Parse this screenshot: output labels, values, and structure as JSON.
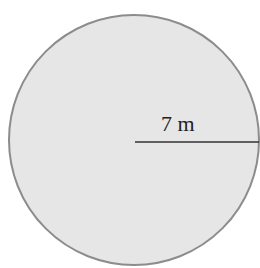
{
  "figure": {
    "shape": "circle",
    "fill_color": "#e6e6e6",
    "stroke_color": "#8c8c8c",
    "radius_line_color": "#333333",
    "radius_label": "7 m"
  }
}
